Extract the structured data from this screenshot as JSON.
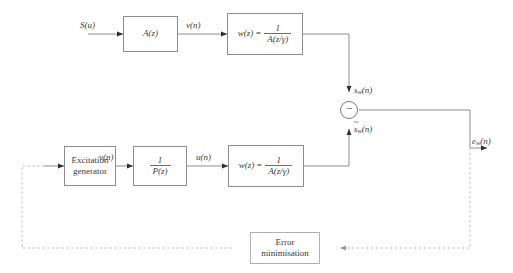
{
  "diagram": {
    "colors": {
      "line": "#8d8d8d",
      "dashed_line": "#bdbdbd",
      "box_border": "#8d8d8d",
      "text": "#3a3a3a",
      "background": "#ffffff"
    },
    "blocks": {
      "analysis_filter": {
        "label": "A(z)"
      },
      "weighting_top": {
        "lhs": "w(z)",
        "eq": "=",
        "numerator": "1",
        "denominator": "A(z/γ)"
      },
      "excitation_generator": {
        "line1": "Excitation",
        "line2": "generator"
      },
      "pitch_filter": {
        "numerator": "1",
        "denominator": "P(z)"
      },
      "weighting_bottom": {
        "lhs": "w(z)",
        "eq": "=",
        "numerator": "1",
        "denominator": "A(z/γ)"
      },
      "error_minimisation": {
        "line1": "Error",
        "line2": "minimisation"
      }
    },
    "signals": {
      "input_speech": {
        "base": "S(u)"
      },
      "v_top": {
        "base": "v",
        "arg": "(n)"
      },
      "v_bottom": {
        "base": "v",
        "arg": "(n)"
      },
      "u_signal": {
        "base": "u",
        "arg": "(n)"
      },
      "sw": {
        "base": "s",
        "sub": "w",
        "arg": "(n)"
      },
      "sw_hat": {
        "base": "s",
        "sub": "w",
        "arg": "(n)",
        "accent": "~"
      },
      "ew": {
        "base": "e",
        "sub": "w",
        "arg": "(n)"
      }
    },
    "summing_junction": {
      "sign": "−"
    }
  }
}
